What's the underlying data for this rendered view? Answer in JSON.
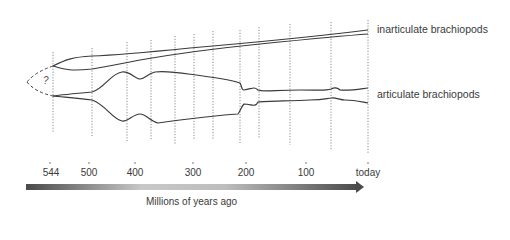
{
  "diagram": {
    "type": "phylogenetic spindle diagram",
    "lineages": [
      {
        "name": "inarticulate brachiopods",
        "label": "inarticulate brachiopods"
      },
      {
        "name": "articulate brachiopods",
        "label": "articulate brachiopods"
      }
    ],
    "unknown_origin_marker": "?",
    "time_axis": {
      "title": "Millions of years ago",
      "ticks": [
        "544",
        "500",
        "400",
        "300",
        "200",
        "100",
        "today"
      ],
      "direction": "left-to-right (past to present)"
    },
    "colors": {
      "line": "#3a3a3a",
      "dotted": "#888888",
      "arrow_start": "#555555",
      "arrow_mid": "#cfcfcf",
      "arrow_end": "#555555"
    }
  }
}
